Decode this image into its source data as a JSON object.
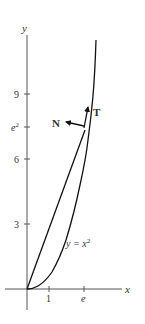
{
  "figure": {
    "axes": {
      "x_label": "x",
      "y_label": "y",
      "x_ticks": [
        {
          "label": "1",
          "value": 1
        },
        {
          "label": "e",
          "value": 2.718
        }
      ],
      "y_ticks": [
        {
          "label": "9",
          "value": 9
        },
        {
          "label": "e",
          "sup": "2",
          "value": 7.389
        },
        {
          "label": "6",
          "value": 6
        },
        {
          "label": "3",
          "value": 3
        }
      ]
    },
    "curve": {
      "equation_lhs": "y = x",
      "equation_sup": "2"
    },
    "vectors": {
      "tangent_label": "T",
      "normal_label": "N"
    },
    "colors": {
      "axis": "#555555",
      "curve": "#111111",
      "text": "#333333"
    }
  }
}
